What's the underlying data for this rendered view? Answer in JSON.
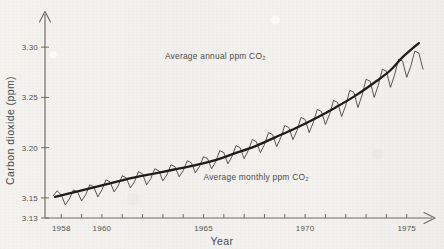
{
  "chart_data": {
    "type": "line",
    "title": "",
    "xlabel": "Year",
    "ylabel": "Carbon dioxide (ppm)",
    "xlim": [
      1957.2,
      1975.9
    ],
    "ylim": [
      3.13,
      3.325
    ],
    "grid": false,
    "legend": "none",
    "x_ticks_major": [
      "1958",
      "1960",
      "1965",
      "1970",
      "1975"
    ],
    "x_tick_values": [
      1958,
      1960,
      1965,
      1970,
      1975
    ],
    "x_minor_tick_years": [
      1957,
      1958,
      1959,
      1960,
      1961,
      1962,
      1963,
      1964,
      1965,
      1966,
      1967,
      1968,
      1969,
      1970,
      1971,
      1972,
      1973,
      1974,
      1975
    ],
    "y_ticks": [
      "3.13",
      "3.15",
      "3.20",
      "3.25",
      "3.30"
    ],
    "y_tick_values": [
      3.13,
      3.15,
      3.2,
      3.25,
      3.3
    ],
    "annotations": [
      {
        "text": "Average annual ppm CO₂",
        "x": 1963.1,
        "y": 3.288
      },
      {
        "text": "Average monthly ppm CO₂",
        "x": 1965.0,
        "y": 3.168
      }
    ],
    "series": [
      {
        "name": "Average monthly ppm CO₂",
        "style": "thin-oscillating",
        "description": "Monthly mean CO2 showing seasonal sawtooth oscillation superimposed on rising trend",
        "x": [
          1957.6,
          1957.8,
          1958.0,
          1958.2,
          1958.4,
          1958.6,
          1958.8,
          1959.0,
          1959.2,
          1959.4,
          1959.6,
          1959.8,
          1960.0,
          1960.2,
          1960.4,
          1960.6,
          1960.8,
          1961.0,
          1961.2,
          1961.4,
          1961.6,
          1961.8,
          1962.0,
          1962.2,
          1962.4,
          1962.6,
          1962.8,
          1963.0,
          1963.2,
          1963.4,
          1963.6,
          1963.8,
          1964.0,
          1964.2,
          1964.4,
          1964.6,
          1964.8,
          1965.0,
          1965.2,
          1965.4,
          1965.6,
          1965.8,
          1966.0,
          1966.2,
          1966.4,
          1966.6,
          1966.8,
          1967.0,
          1967.2,
          1967.4,
          1967.6,
          1967.8,
          1968.0,
          1968.2,
          1968.4,
          1968.6,
          1968.8,
          1969.0,
          1969.2,
          1969.4,
          1969.6,
          1969.8,
          1970.0,
          1970.2,
          1970.4,
          1970.6,
          1970.8,
          1971.0,
          1971.2,
          1971.4,
          1971.6,
          1971.8,
          1972.0,
          1972.2,
          1972.4,
          1972.6,
          1972.8,
          1973.0,
          1973.2,
          1973.4,
          1973.6,
          1973.8,
          1974.0,
          1974.2,
          1974.4,
          1974.6,
          1974.8,
          1975.0,
          1975.2,
          1975.4,
          1975.6,
          1975.8
        ],
        "y": [
          3.152,
          3.157,
          3.153,
          3.143,
          3.149,
          3.158,
          3.156,
          3.147,
          3.153,
          3.163,
          3.161,
          3.151,
          3.158,
          3.168,
          3.166,
          3.156,
          3.162,
          3.172,
          3.17,
          3.16,
          3.166,
          3.176,
          3.174,
          3.163,
          3.169,
          3.179,
          3.177,
          3.167,
          3.173,
          3.183,
          3.181,
          3.171,
          3.177,
          3.187,
          3.185,
          3.175,
          3.181,
          3.191,
          3.189,
          3.179,
          3.186,
          3.197,
          3.195,
          3.184,
          3.191,
          3.202,
          3.2,
          3.189,
          3.197,
          3.208,
          3.206,
          3.195,
          3.203,
          3.215,
          3.213,
          3.201,
          3.21,
          3.222,
          3.22,
          3.208,
          3.217,
          3.23,
          3.228,
          3.215,
          3.225,
          3.238,
          3.236,
          3.223,
          3.233,
          3.247,
          3.245,
          3.231,
          3.242,
          3.257,
          3.255,
          3.24,
          3.252,
          3.268,
          3.266,
          3.25,
          3.262,
          3.278,
          3.276,
          3.26,
          3.272,
          3.288,
          3.286,
          3.27,
          3.281,
          3.296,
          3.294,
          3.278
        ]
      },
      {
        "name": "Average annual ppm CO₂",
        "style": "thick-smooth",
        "description": "Smoothed annual mean trend line",
        "x": [
          1957.7,
          1958.5,
          1959.5,
          1960.5,
          1961.5,
          1962.5,
          1963.5,
          1964.5,
          1965.5,
          1966.5,
          1967.5,
          1968.5,
          1969.5,
          1970.5,
          1971.5,
          1972.5,
          1973.5,
          1974.2,
          1974.8,
          1975.6
        ],
        "y": [
          3.151,
          3.155,
          3.16,
          3.165,
          3.17,
          3.174,
          3.178,
          3.182,
          3.187,
          3.194,
          3.201,
          3.21,
          3.219,
          3.229,
          3.24,
          3.252,
          3.266,
          3.277,
          3.29,
          3.304
        ]
      }
    ]
  },
  "figure": {
    "axis_color": "#6c6c68",
    "monthly_color": "#3a3a38",
    "annual_color": "#1d1d1c",
    "background": "#f3f2ef",
    "text_color": "#55554f"
  }
}
